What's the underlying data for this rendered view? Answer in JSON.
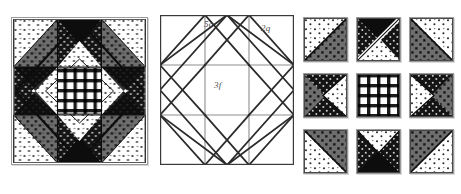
{
  "figure": {
    "kind": "quilt-block-construction-diagram",
    "panels": [
      {
        "id": "finished-block",
        "name": "pieced block"
      },
      {
        "id": "piecing-diagram",
        "name": "line drawing"
      },
      {
        "id": "unit-grid",
        "name": "exploded units"
      }
    ]
  },
  "diagram": {
    "labels": {
      "top_left": "5c",
      "top_right": "2q",
      "center": "3f"
    },
    "grid_divisions": 3,
    "stroke_color": "#2b2b2b",
    "light_stroke_color": "#8d8d8d",
    "background": "#ffffff"
  },
  "fabrics": {
    "light_dot": {
      "name": "light-dotted",
      "fill": "#ffffff",
      "ink": "#2a2a2a"
    },
    "mid_dot": {
      "name": "medium-dotted",
      "fill": "#6f6f6f",
      "ink": "#141414"
    },
    "dark_dot": {
      "name": "dark-dotted",
      "fill": "#151515",
      "ink": "#cfcfcf"
    },
    "gingham": {
      "name": "check-gingham",
      "fill": "#ffffff",
      "ink": "#1a1a1a"
    },
    "solid_black": {
      "name": "solid-dark",
      "fill": "#0d0d0d",
      "ink": "#0d0d0d"
    }
  },
  "finished_block": {
    "title": "pieced quilt block",
    "center_patch": "gingham",
    "center_diamond": "light_dot",
    "points": "solid_black",
    "corner_squares": "mid_dot",
    "corner_triangles": "light_dot"
  },
  "unit_grid": {
    "rows": 3,
    "cols": 3,
    "cells": [
      {
        "pos": "top-left",
        "type": "half-square-triangle",
        "a": "light_dot",
        "b": "mid_dot"
      },
      {
        "pos": "top-center",
        "type": "split-diagonal-pair",
        "a": "dark_dot",
        "b": "light_dot"
      },
      {
        "pos": "top-right",
        "type": "half-square-triangle",
        "a": "light_dot",
        "b": "mid_dot"
      },
      {
        "pos": "middle-left",
        "type": "flying-geese-left",
        "a": "light_dot",
        "b": "dark_dot"
      },
      {
        "pos": "middle-center",
        "type": "plain-square",
        "a": "gingham",
        "b": "gingham"
      },
      {
        "pos": "middle-right",
        "type": "flying-geese-right",
        "a": "light_dot",
        "b": "dark_dot"
      },
      {
        "pos": "bottom-left",
        "type": "half-square-triangle",
        "a": "light_dot",
        "b": "mid_dot"
      },
      {
        "pos": "bottom-center",
        "type": "hourglass",
        "a": "light_dot",
        "b": "dark_dot"
      },
      {
        "pos": "bottom-right",
        "type": "half-square-triangle",
        "a": "light_dot",
        "b": "mid_dot"
      }
    ]
  }
}
